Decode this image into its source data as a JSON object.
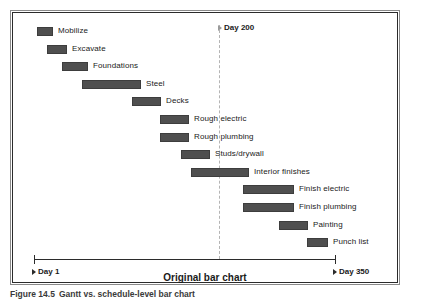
{
  "figure": {
    "caption_number": "Figure 14.5",
    "caption_text": "Gantt vs. schedule-level bar chart",
    "title": "Original bar chart"
  },
  "axis": {
    "start_label": "Day 1",
    "end_label": "Day 350",
    "start_day": 1,
    "end_day": 350,
    "marker_label": "Day 200",
    "marker_day": 200
  },
  "colors": {
    "bar_fill": "#4f4f4f",
    "bar_stroke": "#3d3d3d",
    "axis": "#2b2b2b",
    "marker_line": "#b4b4b4",
    "frame_outer": "#8a8a8a",
    "frame_inner": "#2b2b2b",
    "text": "#1a1a1a",
    "background": "#ffffff"
  },
  "chart_data": {
    "type": "bar",
    "orientation": "horizontal",
    "subtype": "gantt",
    "title": "Original bar chart",
    "xlabel": "",
    "ylabel": "",
    "xlim": [
      1,
      350
    ],
    "grid": false,
    "legend": null,
    "annotations": [
      {
        "label": "Day 200",
        "x": 200,
        "style": "vertical-dashed-line"
      },
      {
        "label": "Day 1",
        "x": 1,
        "style": "axis-endpoint"
      },
      {
        "label": "Day 350",
        "x": 350,
        "style": "axis-endpoint"
      }
    ],
    "categories": [
      "Mobilize",
      "Excavate",
      "Foundations",
      "Steel",
      "Decks",
      "Rough electric",
      "Rough plumbing",
      "Studs/drywall",
      "Interior finishes",
      "Finish electric",
      "Finish plumbing",
      "Painting",
      "Punch list"
    ],
    "tasks": [
      {
        "name": "Mobilize",
        "start_day": 1,
        "end_day": 19,
        "px_left": 26,
        "px_width": 16
      },
      {
        "name": "Excavate",
        "start_day": 19,
        "end_day": 42,
        "px_left": 36,
        "px_width": 20
      },
      {
        "name": "Foundations",
        "start_day": 42,
        "end_day": 72,
        "px_left": 51,
        "px_width": 26
      },
      {
        "name": "Steel",
        "start_day": 72,
        "end_day": 140,
        "px_left": 71,
        "px_width": 59
      },
      {
        "name": "Decks",
        "start_day": 140,
        "end_day": 173,
        "px_left": 121,
        "px_width": 29
      },
      {
        "name": "Rough electric",
        "start_day": 166,
        "end_day": 200,
        "px_left": 149,
        "px_width": 29
      },
      {
        "name": "Rough plumbing",
        "start_day": 166,
        "end_day": 200,
        "px_left": 149,
        "px_width": 29
      },
      {
        "name": "Studs/drywall",
        "start_day": 191,
        "end_day": 225,
        "px_left": 170,
        "px_width": 29
      },
      {
        "name": "Interior finishes",
        "start_day": 191,
        "end_day": 259,
        "px_left": 180,
        "px_width": 58
      },
      {
        "name": "Finish electric",
        "start_day": 253,
        "end_day": 304,
        "px_left": 232,
        "px_width": 51
      },
      {
        "name": "Finish plumbing",
        "start_day": 253,
        "end_day": 304,
        "px_left": 232,
        "px_width": 51
      },
      {
        "name": "Painting",
        "start_day": 287,
        "end_day": 321,
        "px_left": 268,
        "px_width": 29
      },
      {
        "name": "Punch list",
        "start_day": 310,
        "end_day": 333,
        "px_left": 296,
        "px_width": 21
      }
    ],
    "values": [
      18,
      23,
      30,
      68,
      33,
      34,
      34,
      34,
      68,
      51,
      51,
      34,
      23
    ]
  }
}
